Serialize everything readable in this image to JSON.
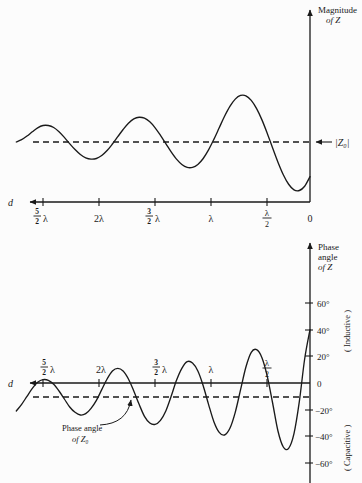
{
  "figure": {
    "background_color": "#fcfcfc",
    "ink_color": "#1a1a1a"
  },
  "chart_data": [
    {
      "type": "line",
      "id": "magnitude-of-z",
      "title": "Magnitude of Z",
      "xlabel": "d",
      "ylabel": "Magnitude of Z",
      "grid": false,
      "legend": null,
      "axis_direction": "x decreases to the right; d increases to the left",
      "xtick_labels": [
        "5/2 λ",
        "2λ",
        "3/2 λ",
        "λ",
        "λ/2",
        "0"
      ],
      "xtick_values": [
        2.5,
        2.0,
        1.5,
        1.0,
        0.5,
        0.0
      ],
      "xlim": [
        2.75,
        0.0
      ],
      "ylim": [
        0,
        1
      ],
      "reference_line": {
        "label": "|Z₀|",
        "style": "dashed",
        "y": 0.38,
        "arrow": "left"
      },
      "description": "Standing-wave impedance magnitude along a lossy line; oscillation amplitude grows as d approaches 0, period lambda/2.",
      "x": [
        2.75,
        2.7,
        2.65,
        2.6,
        2.55,
        2.5,
        2.45,
        2.4,
        2.35,
        2.3,
        2.25,
        2.2,
        2.15,
        2.1,
        2.05,
        2.0,
        1.95,
        1.9,
        1.85,
        1.8,
        1.75,
        1.7,
        1.65,
        1.6,
        1.55,
        1.5,
        1.45,
        1.4,
        1.35,
        1.3,
        1.25,
        1.2,
        1.15,
        1.1,
        1.05,
        1.0,
        0.95,
        0.9,
        0.85,
        0.8,
        0.75,
        0.7,
        0.65,
        0.6,
        0.55,
        0.5,
        0.45,
        0.4,
        0.35,
        0.3,
        0.25,
        0.2,
        0.15,
        0.1,
        0.05,
        0.0
      ],
      "y": [
        0.38,
        0.387,
        0.398,
        0.411,
        0.423,
        0.43,
        0.43,
        0.424,
        0.411,
        0.394,
        0.375,
        0.357,
        0.342,
        0.332,
        0.328,
        0.33,
        0.339,
        0.354,
        0.374,
        0.396,
        0.418,
        0.437,
        0.45,
        0.455,
        0.452,
        0.441,
        0.423,
        0.4,
        0.375,
        0.35,
        0.328,
        0.312,
        0.303,
        0.303,
        0.312,
        0.33,
        0.356,
        0.388,
        0.423,
        0.458,
        0.488,
        0.51,
        0.521,
        0.52,
        0.506,
        0.481,
        0.447,
        0.406,
        0.362,
        0.319,
        0.281,
        0.252,
        0.235,
        0.233,
        0.246,
        0.275
      ]
    },
    {
      "type": "line",
      "id": "phase-angle-of-z",
      "title": "Phase angle of Z",
      "xlabel": "d",
      "ylabel": "Phase angle of Z",
      "grid": false,
      "legend": null,
      "axis_direction": "x decreases to the right; d increases to the left",
      "xtick_labels": [
        "5/2 λ",
        "2λ",
        "3/2 λ",
        "λ",
        "λ/2"
      ],
      "xtick_values": [
        2.5,
        2.0,
        1.5,
        1.0,
        0.5
      ],
      "ytick_labels": [
        "60°",
        "40°",
        "20°",
        "0",
        "-20°",
        "-40°",
        "-60°"
      ],
      "ytick_values": [
        60,
        40,
        20,
        0,
        -20,
        -40,
        -60
      ],
      "ylim": [
        -72,
        72
      ],
      "xlim": [
        2.75,
        0.0
      ],
      "side_label_upper": "( Inductive )",
      "side_label_lower": "( Capacitive )",
      "reference_line": {
        "label_line1": "Phase angle",
        "label_line2": "of Z₀",
        "style": "dashed",
        "y": -10
      },
      "x": [
        2.75,
        2.7,
        2.65,
        2.6,
        2.55,
        2.5,
        2.45,
        2.4,
        2.35,
        2.3,
        2.25,
        2.2,
        2.15,
        2.1,
        2.05,
        2.0,
        1.95,
        1.9,
        1.85,
        1.8,
        1.75,
        1.7,
        1.65,
        1.6,
        1.55,
        1.5,
        1.45,
        1.4,
        1.35,
        1.3,
        1.25,
        1.2,
        1.15,
        1.1,
        1.05,
        1.0,
        0.95,
        0.9,
        0.85,
        0.8,
        0.75,
        0.7,
        0.65,
        0.6,
        0.55,
        0.5,
        0.45,
        0.4,
        0.35,
        0.3,
        0.25,
        0.2,
        0.15,
        0.1,
        0.05,
        0.0
      ],
      "y": [
        -21.0,
        -16.0,
        -10.0,
        -4.0,
        0.5,
        2.5,
        2.0,
        -1.0,
        -6.0,
        -12.0,
        -18.0,
        -22.0,
        -24.0,
        -23.0,
        -19.0,
        -13.0,
        -5.0,
        3.0,
        9.0,
        11.0,
        9.0,
        3.0,
        -6.0,
        -16.0,
        -25.0,
        -30.0,
        -31.0,
        -28.0,
        -21.0,
        -10.0,
        2.0,
        11.0,
        16.0,
        15.0,
        9.0,
        -2.0,
        -16.0,
        -29.0,
        -37.0,
        -39.0,
        -34.0,
        -22.0,
        -5.0,
        12.0,
        23.0,
        25.0,
        19.0,
        5.0,
        -15.0,
        -36.0,
        -48.0,
        -49.0,
        -38.0,
        -14.0,
        18.0,
        40.0
      ]
    }
  ],
  "annotations": {
    "magnitude_axis_title_line1": "Magnitude",
    "magnitude_axis_title_line2": "of Z",
    "phase_axis_title_line1": "Phase",
    "phase_axis_title_line2": "angle",
    "phase_axis_title_line3": "of Z",
    "d_label": "d",
    "z0_label": "|Z₀|",
    "phase_z0_line1": "Phase angle",
    "phase_z0_line2": "of Z₀",
    "inductive": "( Inductive )",
    "capacitive": "( Capacitive )"
  },
  "tick_text": {
    "five_halves_num": "5",
    "five_halves_den": "2",
    "lambda": "λ",
    "two_lambda": "2λ",
    "three_halves_num": "3",
    "three_halves_den": "2",
    "lambda_over_2_num": "λ",
    "lambda_over_2_den": "2",
    "zero": "0",
    "deg60": "60°",
    "deg40": "40°",
    "deg20": "20°",
    "deg0": "0",
    "degm20": "−20°",
    "degm40": "−40°",
    "degm60": "−60°"
  }
}
